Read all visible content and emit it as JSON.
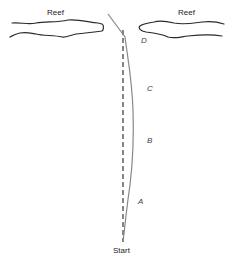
{
  "labels": {
    "reef_left": "Reef",
    "reef_right": "Reef",
    "start": "Start",
    "point_a": "A",
    "point_b": "B",
    "point_c": "C",
    "point_d": "D"
  },
  "colors": {
    "reef_outline": "#2a2a2a",
    "actual_path": "#888888",
    "intended_path": "#444444"
  },
  "paths": {
    "actual_path": "solid line from Start through A, B, C, D to reef gap",
    "intended_path": "dashed straight line from Start toward reef gap"
  }
}
